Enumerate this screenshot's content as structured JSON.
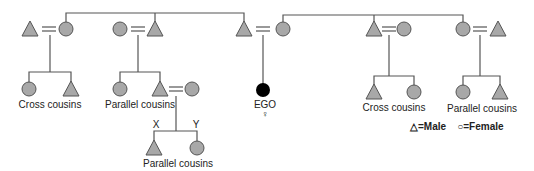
{
  "diagram": {
    "type": "kinship-chart",
    "colors": {
      "fill": "#a8a8a8",
      "ego": "#000000",
      "line": "#555555"
    },
    "labels": {
      "left_cross": "Cross cousins",
      "left_parallel": "Parallel cousins",
      "ego": "EGO",
      "ego_sex_symbol": "♀",
      "right_cross": "Cross cousins",
      "right_parallel": "Parallel cousins",
      "bottom_parallel": "Parallel cousins",
      "x_marker": "X",
      "y_marker": "Y"
    },
    "legend": {
      "male_symbol": "△",
      "male_label": "=Male",
      "female_symbol": "○",
      "female_label": "=Female"
    }
  }
}
